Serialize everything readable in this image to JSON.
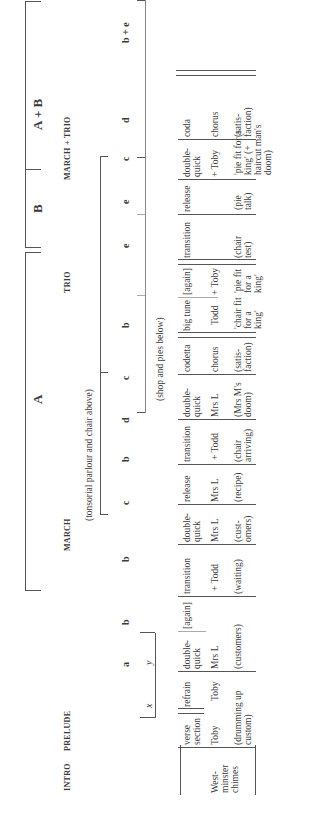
{
  "sections": [
    {
      "label": "A",
      "x": 415
    },
    {
      "label": "B",
      "x": 606
    },
    {
      "label": "A + B",
      "x": 688
    }
  ],
  "forms": [
    {
      "label": "INTRO",
      "x": 30
    },
    {
      "label": "PRELUDE",
      "x": 70
    },
    {
      "label": "MARCH",
      "x": 270
    },
    {
      "label": "TRIO",
      "x": 525
    },
    {
      "label": "MARCH + TRIO",
      "x": 666
    }
  ],
  "scene_notes": {
    "above": "(tonsorial parlour and chair above)",
    "below": "(shop and pies below)"
  },
  "letters": [
    {
      "label": "a",
      "x": 148,
      "italic": false
    },
    {
      "label": "b",
      "x": 190,
      "italic": false
    },
    {
      "label": "b",
      "x": 253,
      "italic": false
    },
    {
      "label": "c",
      "x": 310,
      "italic": false
    },
    {
      "label": "b",
      "x": 353,
      "italic": false
    },
    {
      "label": "d",
      "x": 392,
      "italic": false
    },
    {
      "label": "c",
      "x": 435,
      "italic": false
    },
    {
      "label": "b",
      "x": 487,
      "italic": false
    },
    {
      "label": "e",
      "x": 566,
      "italic": false
    },
    {
      "label": "e",
      "x": 618,
      "italic": false
    },
    {
      "label": "c",
      "x": 653,
      "italic": false
    },
    {
      "label": "d",
      "x": 615,
      "italic": false
    },
    {
      "label": "b + e",
      "x": 697,
      "italic": false
    }
  ],
  "subletters": [
    {
      "label": "x",
      "x": 100
    },
    {
      "label": "y",
      "x": 145
    }
  ],
  "table": {
    "columns": [
      {
        "header": "",
        "role": "West-minster chimes",
        "note": ""
      },
      {
        "header": "verse section",
        "role": "Toby",
        "note": "(drumming up custom)"
      },
      {
        "header": "refrain",
        "role": "Toby",
        "note": ""
      },
      {
        "header": "double-quick",
        "role": "Mrs L",
        "note": "(customers)"
      },
      {
        "header": "[again]",
        "role": "",
        "note": ""
      },
      {
        "header": "transition",
        "role": "+ Todd",
        "note": "(waiting)"
      },
      {
        "header": "double-quick",
        "role": "Mrs L",
        "note": "(cust-omers)"
      },
      {
        "header": "release",
        "role": "Mrs L",
        "note": "(recipe)"
      },
      {
        "header": "transition",
        "role": "+ Todd",
        "note": "(chair arriving)"
      },
      {
        "header": "double-quick",
        "role": "Mrs L",
        "note": "(Mrs M's doom)"
      },
      {
        "header": "codetta",
        "role": "chorus",
        "note": "(satis-faction)"
      },
      {
        "header": "big tune",
        "role": "Todd",
        "note": "'chair fit for a king'"
      },
      {
        "header": "[again]",
        "role": "+ Toby",
        "note": "'pie fit for a king'"
      },
      {
        "header": "transition",
        "role": "",
        "note": "(chair test)"
      },
      {
        "header": "release",
        "role": "",
        "note": "(pie talk)"
      },
      {
        "header": "double-quick",
        "role": "+ Toby",
        "note": "'pie fit for a king' (+ haircut man's doom)"
      },
      {
        "header": "coda",
        "role": "chorus",
        "note": "(satis-faction)"
      }
    ]
  }
}
